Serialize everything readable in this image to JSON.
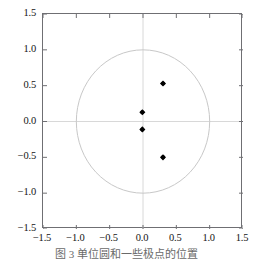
{
  "chart_data": {
    "type": "scatter",
    "title": "",
    "xlabel": "",
    "ylabel": "",
    "xlim": [
      -1.5,
      1.5
    ],
    "ylim": [
      -1.5,
      1.5
    ],
    "grid": false,
    "legend": null,
    "xticks": [
      "-1.5",
      "-1.0",
      "-0.5",
      "0.0",
      "0.5",
      "1.0",
      "1.5"
    ],
    "yticks": [
      "1.5",
      "1.0",
      "0.5",
      "0.0",
      "-0.5",
      "-1.0",
      "-1.5"
    ],
    "xtick_values": [
      -1.5,
      -1.0,
      -0.5,
      0.0,
      0.5,
      1.0,
      1.5
    ],
    "ytick_values": [
      1.5,
      1.0,
      0.5,
      0.0,
      -0.5,
      -1.0,
      -1.5
    ],
    "series": [
      {
        "name": "poles",
        "marker": "point",
        "color": "#000000",
        "points": [
          {
            "x": 0.3,
            "y": 0.53
          },
          {
            "x": -0.01,
            "y": 0.13
          },
          {
            "x": -0.01,
            "y": -0.11
          },
          {
            "x": 0.3,
            "y": -0.5
          }
        ]
      }
    ],
    "annotations": [
      {
        "kind": "circle",
        "name": "unit-circle",
        "cx": 0.0,
        "cy": 0.0,
        "r": 1.0,
        "color": "#c8c8c8"
      },
      {
        "kind": "axis-line",
        "name": "zero-horizontal",
        "value": 0.0,
        "orientation": "horizontal",
        "color": "#d8d8d8"
      },
      {
        "kind": "axis-line",
        "name": "zero-vertical",
        "value": 0.0,
        "orientation": "vertical",
        "color": "#d8d8d8"
      }
    ]
  },
  "caption": {
    "text": "图 3   单位圆和一些极点的位置"
  },
  "colors": {
    "frame": "#6f6f73",
    "circle": "#c8c8c8",
    "zero_line": "#d8d8d8",
    "marker": "#000000",
    "text": "#141414"
  }
}
